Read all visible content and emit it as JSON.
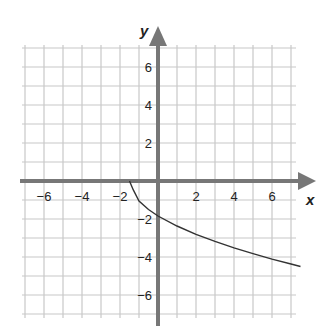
{
  "chart_data": {
    "type": "line",
    "title": "",
    "xlabel": "x",
    "ylabel": "y",
    "xlim": [
      -7,
      7.5
    ],
    "ylim": [
      -7.5,
      7.5
    ],
    "grid": true,
    "x_ticks": [
      -6,
      -4,
      -2,
      2,
      4,
      6
    ],
    "y_ticks": [
      6,
      4,
      2,
      -2,
      -4,
      -6
    ],
    "x_tick_labels": [
      "−6",
      "−4",
      "−2",
      "2",
      "4",
      "6"
    ],
    "y_tick_labels": [
      "6",
      "4",
      "2",
      "−2",
      "−4",
      "−6"
    ],
    "series": [
      {
        "name": "curve",
        "color": "#333333",
        "x": [
          -1.5,
          -1.3,
          -1.0,
          -0.5,
          0,
          1,
          2,
          3,
          4,
          5,
          6,
          7,
          7.5
        ],
        "y": [
          0,
          -0.47,
          -1.06,
          -1.5,
          -1.84,
          -2.37,
          -2.81,
          -3.18,
          -3.52,
          -3.82,
          -4.11,
          -4.37,
          -4.5
        ]
      }
    ]
  },
  "labels": {
    "x_axis": "x",
    "y_axis": "y"
  },
  "colors": {
    "grid": "#c8c8c8",
    "axis": "#777777",
    "curve": "#333333"
  }
}
